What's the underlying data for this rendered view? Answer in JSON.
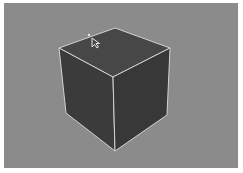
{
  "viewport": {
    "background": "#8b8b8b",
    "object": {
      "type": "cube",
      "state": "selected",
      "face_top_color": "#474747",
      "face_left_color": "#3b3b3b",
      "face_right_color": "#383838",
      "edge_color": "#d2d2d2"
    },
    "cursor": {
      "icon": "arrow-cursor-icon",
      "x": 92,
      "y": 38
    }
  }
}
